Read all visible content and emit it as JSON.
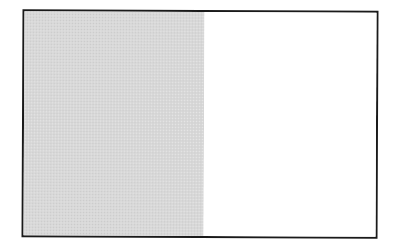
{
  "diagram": {
    "type": "fraction-area-model",
    "shape": "rectangle",
    "orientation": "vertical-split",
    "parts_total": 2,
    "parts_shaded": 1,
    "parts": [
      {
        "index": 0,
        "shaded": true,
        "color": "#d8d8d8",
        "width_ratio": 0.51
      },
      {
        "index": 1,
        "shaded": false,
        "color": "#ffffff",
        "width_ratio": 0.49
      }
    ],
    "border_color": "#1a1a1a",
    "fraction_shaded": "1/2"
  }
}
